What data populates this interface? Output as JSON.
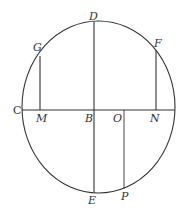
{
  "diagram": {
    "type": "geometry",
    "colors": {
      "stroke": "#333333",
      "background": "#ffffff"
    },
    "labels": {
      "D": "D",
      "G": "G",
      "F": "F",
      "C": "C",
      "M": "M",
      "B": "B",
      "O": "O",
      "N": "N",
      "E": "E",
      "P": "P"
    }
  }
}
